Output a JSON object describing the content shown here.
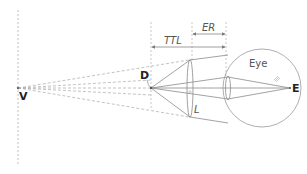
{
  "diagram": {
    "labels": {
      "V": "V",
      "D": "D",
      "L": "L",
      "E": "E",
      "eye": "Eye",
      "TTL": "TTL",
      "ER": "ER"
    },
    "colors": {
      "line": "#8a8a8a",
      "dashed": "#9a9a9a",
      "text": "#333333"
    }
  }
}
